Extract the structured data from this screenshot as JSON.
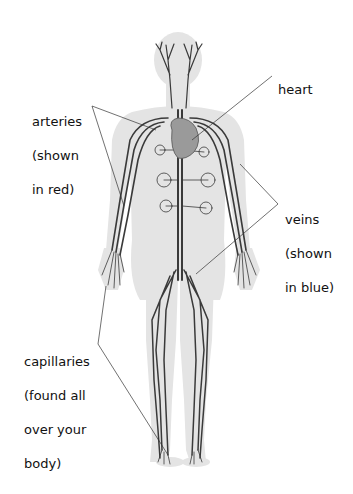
{
  "diagram": {
    "colors": {
      "silhouette": "#e2e2e2",
      "vessel": "#3a3a3a",
      "heart": "#9a9a9a",
      "leader": "#333333"
    },
    "labels": {
      "heart": {
        "lines": [
          "heart"
        ]
      },
      "arteries": {
        "lines": [
          "arteries",
          "(shown",
          "in red)"
        ]
      },
      "veins": {
        "lines": [
          "veins",
          "(shown",
          "in blue)"
        ]
      },
      "capillaries": {
        "lines": [
          "capillaries",
          "(found all",
          "over your",
          "body)"
        ]
      }
    }
  }
}
